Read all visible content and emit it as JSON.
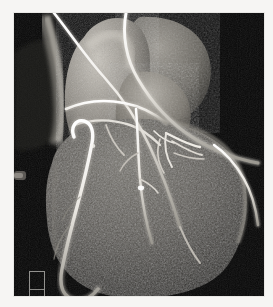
{
  "viewer": {
    "name": "volume-rendered-cardiac-ct-viewer",
    "modality_label": "3D volume rendering",
    "background_color": "#f6f5f3",
    "canvas_color": "#050505",
    "canvas": {
      "x": 14,
      "y": 13,
      "width": 250,
      "height": 283
    }
  },
  "image": {
    "title": "Volume-rendered cardiac CT angiography of the heart with coronary arteries",
    "orientation": "anterior view",
    "structures": [
      {
        "label": "ascending aorta / aortic root",
        "tone": "bright gray"
      },
      {
        "label": "pulmonary artery trunk",
        "tone": "mid gray"
      },
      {
        "label": "right atrial appendage",
        "tone": "mid gray"
      },
      {
        "label": "left ventricle myocardium",
        "tone": "dark speckled gray"
      },
      {
        "label": "right coronary artery",
        "tone": "bright white"
      },
      {
        "label": "left anterior descending artery",
        "tone": "bright white"
      },
      {
        "label": "diagonal branch",
        "tone": "bright white"
      },
      {
        "label": "bypass graft / marginal branch",
        "tone": "bright white"
      }
    ],
    "scale_marker": {
      "visible": true,
      "label": "",
      "x": 15,
      "y": 258,
      "width": 16,
      "height": 37
    }
  },
  "colors": {
    "vessel_bright": "#f2f0ec",
    "vessel_mid": "#c9c6bf",
    "tissue_light": "#b2afa8",
    "tissue_mid": "#7d7a74",
    "tissue_dark": "#3b3934",
    "background_dark": "#070707",
    "page_background": "#f6f5f3"
  }
}
